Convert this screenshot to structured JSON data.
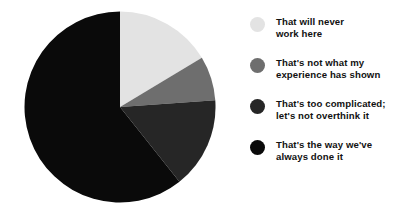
{
  "chart_data": {
    "type": "pie",
    "title": "",
    "subtitle": "",
    "xlabel": "",
    "ylabel": "",
    "grid": false,
    "legend_position": "right",
    "start_angle_deg": 0,
    "direction": "clockwise",
    "categories": [
      "That will never work here",
      "That's not what my experience has shown",
      "That's too complicated; let's not overthink it",
      "That's the way we've always done it"
    ],
    "values": [
      16.4,
      7.5,
      15.4,
      60.7
    ],
    "value_unit": "percent",
    "slice_angles_deg": [
      59,
      27,
      55.5,
      218.5
    ],
    "colors": [
      "#e3e3e3",
      "#6e6e6e",
      "#262626",
      "#0a0a0a"
    ],
    "geometry": {
      "center_x": 96,
      "center_y": 96,
      "radius": 95.5
    }
  },
  "legend": {
    "items": [
      {
        "label": "That will never\nwork here",
        "color": "#e3e3e3",
        "swatch_name": "legend-swatch-never-work-here"
      },
      {
        "label": "That's not what my\nexperience has shown",
        "color": "#6e6e6e",
        "swatch_name": "legend-swatch-not-my-experience"
      },
      {
        "label": "That's too complicated;\nlet's not overthink it",
        "color": "#262626",
        "swatch_name": "legend-swatch-too-complicated"
      },
      {
        "label": "That's the way we've\nalways done it",
        "color": "#0a0a0a",
        "swatch_name": "legend-swatch-always-done-it"
      }
    ]
  },
  "canvas": {
    "background": "#ffffff",
    "width": 409,
    "height": 217
  }
}
